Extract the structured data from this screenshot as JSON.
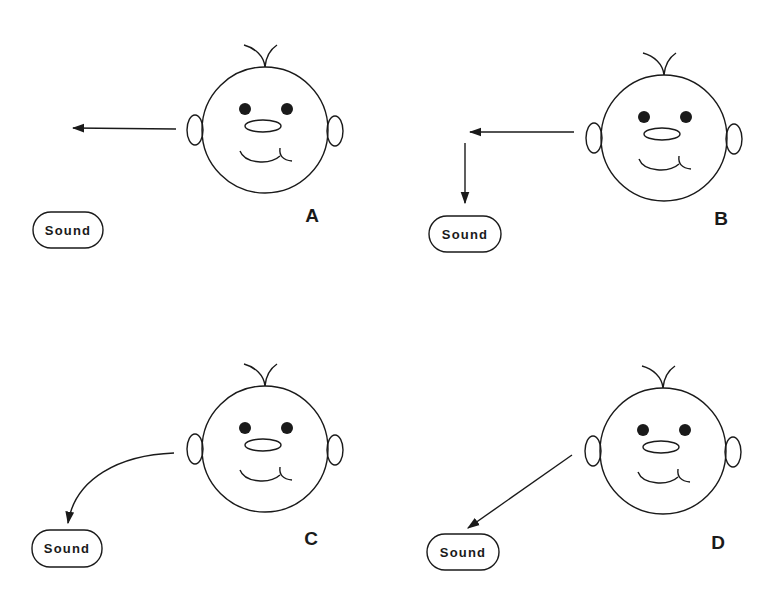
{
  "figure": {
    "background": "#ffffff",
    "ink_color": "#1a1a1a",
    "panels": [
      {
        "id": "A",
        "label": "A",
        "sound_label": "Sound",
        "arrow_type": "straight-left"
      },
      {
        "id": "B",
        "label": "B",
        "sound_label": "Sound",
        "arrow_type": "left-then-down"
      },
      {
        "id": "C",
        "label": "C",
        "sound_label": "Sound",
        "arrow_type": "curved-down-left"
      },
      {
        "id": "D",
        "label": "D",
        "sound_label": "Sound",
        "arrow_type": "diagonal-down-left"
      }
    ]
  }
}
